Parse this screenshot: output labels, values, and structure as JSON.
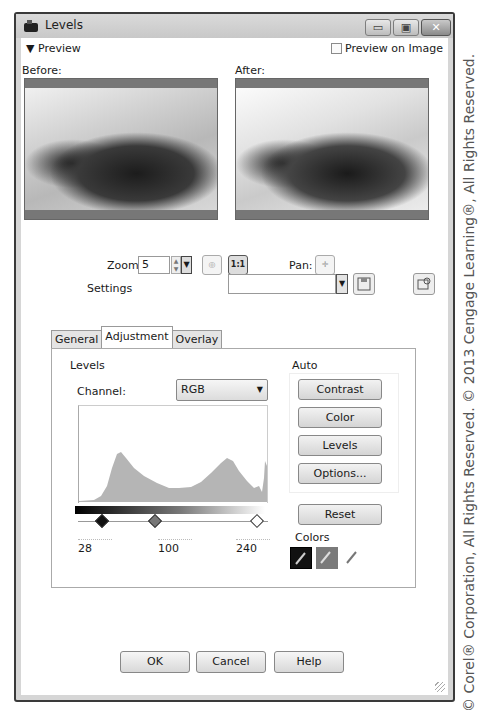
{
  "window": {
    "title": "Levels",
    "controls": {
      "minimize": "minimize",
      "maximize": "maximize",
      "close": "close"
    }
  },
  "preview": {
    "toggle_label": "Preview",
    "preview_on_image_label": "Preview on Image",
    "preview_on_image_checked": false,
    "before_label": "Before:",
    "after_label": "After:",
    "zoom_label": "Zoom:",
    "zoom_value": "5",
    "pan_label": "Pan:"
  },
  "settings": {
    "label": "Settings",
    "value": ""
  },
  "tabs": [
    {
      "label": "General",
      "active": false
    },
    {
      "label": "Adjustment",
      "active": true
    },
    {
      "label": "Overlay",
      "active": false
    }
  ],
  "levels": {
    "group_title": "Levels",
    "channel_label": "Channel:",
    "channel_value": "RGB",
    "input_black": "28",
    "input_gamma": "100",
    "input_white": "240"
  },
  "auto": {
    "group_title": "Auto",
    "buttons": [
      "Contrast",
      "Color",
      "Levels",
      "Options..."
    ]
  },
  "reset_label": "Reset",
  "colors": {
    "group_title": "Colors",
    "swatches": [
      {
        "name": "black-point",
        "color": "#111111"
      },
      {
        "name": "gray-point",
        "color": "#7a7a7a"
      },
      {
        "name": "white-point",
        "color": "#ffffff"
      }
    ]
  },
  "footer": {
    "ok": "OK",
    "cancel": "Cancel",
    "help": "Help"
  },
  "copyright": "© Corel® Corporation, All Rights Reserved. © 2013 Cengage Learning®, All Rights Reserved."
}
